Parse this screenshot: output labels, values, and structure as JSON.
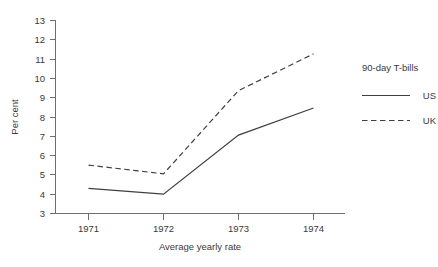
{
  "chart_data": {
    "type": "line",
    "title": "",
    "xlabel": "Average yearly rate",
    "ylabel": "Per cent",
    "categories": [
      "1971",
      "1972",
      "1973",
      "1974"
    ],
    "series": [
      {
        "name": "US",
        "style": "solid",
        "values": [
          4.3,
          4.0,
          7.05,
          8.45
        ]
      },
      {
        "name": "UK",
        "style": "dashed",
        "values": [
          5.5,
          5.05,
          9.35,
          11.25
        ]
      }
    ],
    "ylim": [
      3,
      13
    ],
    "yticks": [
      "3",
      "4",
      "5",
      "6",
      "7",
      "8",
      "9",
      "10",
      "11",
      "12",
      "13"
    ],
    "xticks": [
      "1971",
      "1972",
      "1973",
      "1974"
    ],
    "grid": false,
    "legend_position": "right",
    "legend_title": "90-day T-bills",
    "colors": {
      "line": "#3f3f3f",
      "axis": "#6e6e6e",
      "text": "#3a3a3a",
      "background": "#ffffff"
    }
  },
  "axes": {
    "y_label": "Per cent",
    "x_label": "Average yearly rate",
    "y_ticks": [
      {
        "value": "13"
      },
      {
        "value": "12"
      },
      {
        "value": "11"
      },
      {
        "value": "10"
      },
      {
        "value": "9"
      },
      {
        "value": "8"
      },
      {
        "value": "7"
      },
      {
        "value": "6"
      },
      {
        "value": "5"
      },
      {
        "value": "4"
      },
      {
        "value": "3"
      }
    ],
    "x_ticks": [
      {
        "value": "1971"
      },
      {
        "value": "1972"
      },
      {
        "value": "1973"
      },
      {
        "value": "1974"
      }
    ]
  },
  "legend": {
    "title": "90-day T-bills",
    "entries": [
      {
        "label": "US",
        "style": "solid"
      },
      {
        "label": "UK",
        "style": "dashed"
      }
    ]
  }
}
